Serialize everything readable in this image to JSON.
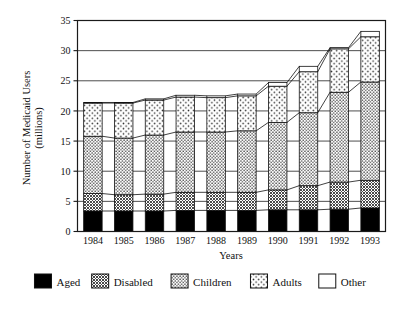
{
  "chart_data": {
    "type": "bar",
    "stacked": true,
    "title": "",
    "subtitle": "",
    "xlabel": "Years",
    "ylabel": "Number of Medicaid Users (millions)",
    "categories": [
      "1984",
      "1985",
      "1986",
      "1987",
      "1988",
      "1989",
      "1990",
      "1991",
      "1992",
      "1993"
    ],
    "ylim": [
      0,
      35
    ],
    "yticks": [
      0,
      5,
      10,
      15,
      20,
      25,
      30,
      35
    ],
    "ytick_labels": [
      "0",
      "5",
      "10",
      "15",
      "20",
      "25",
      "30",
      "35"
    ],
    "grid": true,
    "grid_axis": "y",
    "legend_position": "below",
    "series": [
      {
        "name": "Aged",
        "pattern": "solid-black",
        "color": "#000000",
        "values": [
          3.4,
          3.4,
          3.4,
          3.5,
          3.5,
          3.5,
          3.6,
          3.6,
          3.7,
          3.9
        ]
      },
      {
        "name": "Disabled",
        "pattern": "dense-dark-checker",
        "color": "#6e6e6e",
        "values": [
          2.9,
          2.7,
          2.8,
          3.0,
          3.0,
          3.0,
          3.3,
          4.0,
          4.5,
          4.6
        ]
      },
      {
        "name": "Children",
        "pattern": "dense-dots",
        "color": "#c9c9c9",
        "values": [
          9.5,
          9.4,
          9.8,
          10.0,
          10.0,
          10.2,
          11.2,
          12.1,
          14.9,
          16.3
        ]
      },
      {
        "name": "Adults",
        "pattern": "sparse-dots",
        "color": "#e8e8e8",
        "values": [
          5.5,
          5.8,
          5.8,
          5.8,
          5.7,
          5.8,
          6.0,
          6.8,
          7.2,
          7.5
        ]
      },
      {
        "name": "Other",
        "pattern": "white-empty",
        "color": "#ffffff",
        "values": [
          0.1,
          0.1,
          0.2,
          0.3,
          0.3,
          0.3,
          0.6,
          0.9,
          0.2,
          0.9
        ]
      }
    ],
    "totals": [
      21.4,
      21.4,
      22.0,
      22.6,
      22.5,
      22.8,
      24.7,
      27.4,
      30.5,
      33.2
    ]
  },
  "legend": {
    "items": [
      {
        "label": "Aged"
      },
      {
        "label": "Disabled"
      },
      {
        "label": "Children"
      },
      {
        "label": "Adults"
      },
      {
        "label": "Other"
      }
    ]
  },
  "axes": {
    "y_title_line1": "Number of Medicaid Users",
    "y_title_line2": "(millions)",
    "x_title": "Years"
  },
  "style": {
    "frame_color": "#1a1a1a",
    "grid_color": "#3a3a3a",
    "background": "#ffffff"
  }
}
